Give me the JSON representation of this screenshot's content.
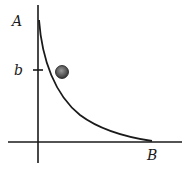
{
  "diagram": {
    "labels": {
      "y_axis_top": "A",
      "tick_label": "b",
      "x_axis_end": "B"
    },
    "elements": {
      "curve": "decreasing convex curve from A to B",
      "ball": "shaded ball resting against curve near b"
    },
    "colors": {
      "line": "#1a1a1a",
      "ball_fill": "#555555",
      "background": "#ffffff"
    }
  }
}
